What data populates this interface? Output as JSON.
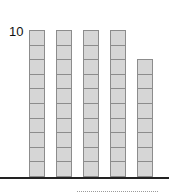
{
  "diagram": {
    "type": "base-ten-blocks",
    "label": "10",
    "unit_height_px": 14.7,
    "rods": [
      {
        "units": 10,
        "x": 29
      },
      {
        "units": 10,
        "x": 56
      },
      {
        "units": 10,
        "x": 83
      },
      {
        "units": 10,
        "x": 110
      },
      {
        "units": 8,
        "x": 137
      }
    ],
    "colors": {
      "block_fill": "#d6d6d6",
      "block_border": "#8c8c8c",
      "baseline": "#222222",
      "answer_line": "#9a9a9a"
    },
    "answer": ""
  }
}
